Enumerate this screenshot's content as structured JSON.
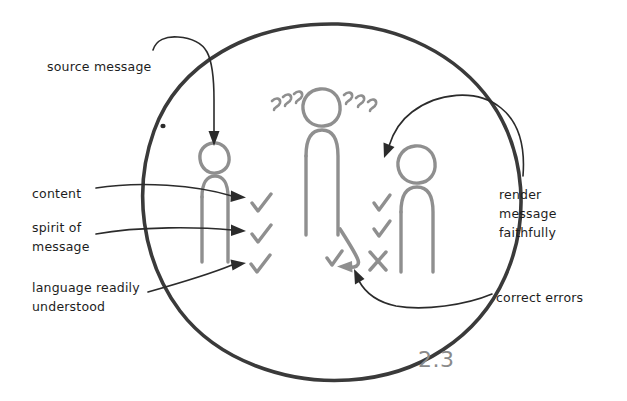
{
  "diagram": {
    "figure_number": "2.3",
    "colors": {
      "ink_black": "#2b2b2b",
      "ink_gray": "#8a8a8a",
      "figure_gray": "#8f8f8f",
      "background": "#ffffff"
    },
    "boundary": {
      "shape": "hand-drawn-circle",
      "label": "interpreting event boundary"
    },
    "labels": {
      "source_message": "source message",
      "content": "content",
      "spirit_of_message": "spirit of\nmessage",
      "language_readily_understood": "language readily\nunderstood",
      "render_message_faithfully": "render\nmessage\nfaithfully",
      "correct_errors": "correct errors"
    },
    "figures": [
      {
        "name": "speaker-figure",
        "role": "source speaker",
        "marks": [
          "check",
          "check",
          "check"
        ]
      },
      {
        "name": "interpreter-figure",
        "role": "interpreter",
        "thinking": "???"
      },
      {
        "name": "listener-figure",
        "role": "receiver",
        "marks": [
          "check",
          "check",
          "cross"
        ]
      }
    ],
    "marks": {
      "check_glyph": "✓",
      "cross_glyph": "✗",
      "thinking_glyph": "???"
    }
  }
}
